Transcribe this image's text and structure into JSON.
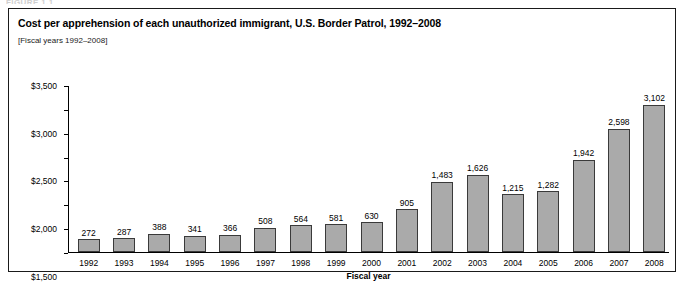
{
  "top_fragment": "FIGURE 1.1",
  "figure": {
    "title": "Cost per apprehension of each unauthorized immigrant, U.S. Border Patrol, 1992–2008",
    "subtitle": "[Fiscal years 1992–2008]"
  },
  "chart_data": {
    "type": "bar",
    "title": "Cost per apprehension of each unauthorized immigrant, U.S. Border Patrol, 1992–2008",
    "subtitle": "[Fiscal years 1992–2008]",
    "xlabel": "Fiscal year",
    "ylabel": "",
    "categories": [
      "1992",
      "1993",
      "1994",
      "1995",
      "1996",
      "1997",
      "1998",
      "1999",
      "2000",
      "2001",
      "2002",
      "2003",
      "2004",
      "2005",
      "2006",
      "2007",
      "2008"
    ],
    "values": [
      272,
      287,
      388,
      341,
      366,
      508,
      564,
      581,
      630,
      905,
      1483,
      1626,
      1215,
      1282,
      1942,
      2598,
      3102
    ],
    "value_labels": [
      "272",
      "287",
      "388",
      "341",
      "366",
      "508",
      "564",
      "581",
      "630",
      "905",
      "1,483",
      "1,626",
      "1,215",
      "1,282",
      "1,942",
      "2,598",
      "3,102"
    ],
    "ylim": [
      0,
      3500
    ],
    "ytick_values": [
      0,
      500,
      1000,
      1500,
      2000,
      2500,
      3000,
      3500
    ],
    "ytick_labels": [
      "$0",
      "$500",
      "$1,000",
      "$1,500",
      "$2,000",
      "$2,500",
      "$3,000",
      "$3,500"
    ],
    "grid": false,
    "legend": false,
    "bar_color": "#aaaaaa",
    "bar_border_color": "#3a3a3a",
    "axis_color": "#000000"
  }
}
